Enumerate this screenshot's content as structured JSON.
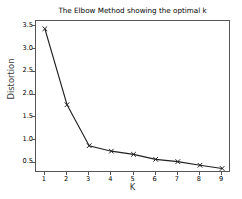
{
  "chart_data": {
    "type": "line",
    "title": "The Elbow Method showing the optimal k",
    "xlabel": "K",
    "ylabel": "Distortion",
    "x": [
      1,
      2,
      3,
      4,
      5,
      6,
      7,
      8,
      9
    ],
    "values": [
      3.45,
      1.78,
      0.88,
      0.76,
      0.69,
      0.58,
      0.53,
      0.45,
      0.38
    ],
    "series": [
      {
        "name": "Distortion",
        "values": [
          3.45,
          1.78,
          0.88,
          0.76,
          0.69,
          0.58,
          0.53,
          0.45,
          0.38
        ]
      }
    ],
    "xtick_labels": [
      "1",
      "2",
      "3",
      "4",
      "5",
      "6",
      "7",
      "8",
      "9"
    ],
    "ytick_labels": [
      "0.5",
      "1.0",
      "1.5",
      "2.0",
      "2.5",
      "3.0",
      "3.5"
    ],
    "ytick_values": [
      0.5,
      1.0,
      1.5,
      2.0,
      2.5,
      3.0,
      3.5
    ],
    "xlim": [
      0.6,
      9.4
    ],
    "ylim": [
      0.28,
      3.62
    ],
    "grid": false,
    "legend": false,
    "marker": "x",
    "line_color": "#1f1f1f",
    "marker_color": "#1f1f1f",
    "axes_color": "#555555",
    "background_color": "#ffffff"
  }
}
